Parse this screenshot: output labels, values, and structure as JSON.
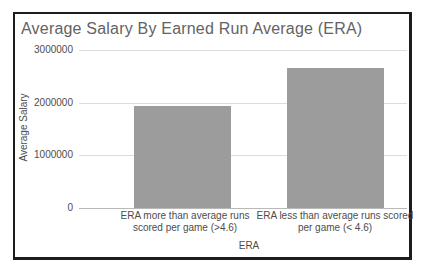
{
  "window": {
    "background": "#ffffff"
  },
  "chart": {
    "title": "Average Salary By Earned Run Average (ERA)",
    "colors": {
      "bar": "#9c9c9c",
      "gridline": "#dcdcdc",
      "axis_line": "#b9b9b9",
      "title_text": "#636363",
      "label_text": "#4d4d4d",
      "frame_border": "#1c1c1c"
    }
  },
  "chart_data": {
    "type": "bar",
    "title": "Average Salary By Earned Run Average (ERA)",
    "xlabel": "ERA",
    "ylabel": "Average Salary",
    "categories": [
      "ERA more than average runs scored per game (>4.6)",
      "ERA less than average runs scored per game (< 4.6)"
    ],
    "values": [
      1930000,
      2660000
    ],
    "ylim": [
      0,
      3000000
    ],
    "yticks": [
      0,
      1000000,
      2000000,
      3000000
    ],
    "ytick_labels": [
      "0",
      "1000000",
      "2000000",
      "3000000"
    ],
    "grid": "horizontal",
    "legend": "none",
    "bar_color": "#9c9c9c"
  }
}
